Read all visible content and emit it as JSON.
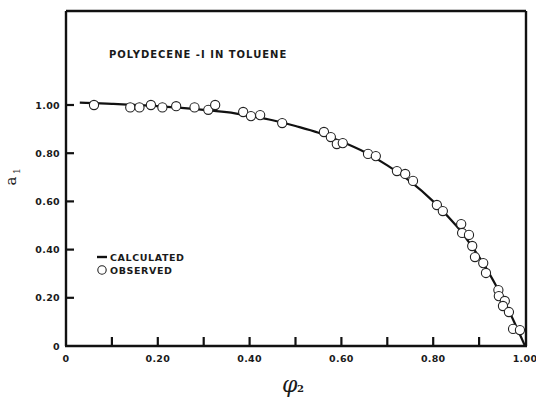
{
  "chart_data": {
    "type": "scatter",
    "title": "POLYDECENE -I IN TOLUENE",
    "xlabel": "φ2",
    "ylabel": "a1",
    "xlim": [
      0,
      1.0
    ],
    "ylim": [
      0,
      1.2
    ],
    "grid": false,
    "legend_position": "inside-left-middle",
    "x_ticks": [
      0,
      0.1,
      0.2,
      0.3,
      0.4,
      0.5,
      0.6,
      0.7,
      0.8,
      0.9,
      1.0
    ],
    "x_tick_labels": [
      {
        "value": 0,
        "label": "0"
      },
      {
        "value": 0.2,
        "label": "0.20"
      },
      {
        "value": 0.4,
        "label": "0.40"
      },
      {
        "value": 0.6,
        "label": "0.60"
      },
      {
        "value": 0.8,
        "label": "0.80"
      },
      {
        "value": 1.0,
        "label": "1.00"
      }
    ],
    "y_tick_labels": [
      {
        "value": 0,
        "label": "0"
      },
      {
        "value": 0.2,
        "label": "0.20"
      },
      {
        "value": 0.4,
        "label": "0.40"
      },
      {
        "value": 0.6,
        "label": "0.60"
      },
      {
        "value": 0.8,
        "label": "0.80"
      },
      {
        "value": 1.0,
        "label": "1.00"
      }
    ],
    "series": [
      {
        "name": "CALCULATED",
        "style": "line",
        "x": [
          0.03,
          0.1,
          0.2,
          0.3,
          0.35,
          0.4,
          0.45,
          0.5,
          0.55,
          0.6,
          0.65,
          0.7,
          0.75,
          0.8,
          0.85,
          0.88,
          0.91,
          0.94,
          0.96,
          0.98,
          1.0
        ],
        "y": [
          1.01,
          1.005,
          0.995,
          0.98,
          0.97,
          0.955,
          0.937,
          0.913,
          0.885,
          0.848,
          0.805,
          0.75,
          0.683,
          0.6,
          0.5,
          0.425,
          0.34,
          0.24,
          0.165,
          0.085,
          0.0
        ]
      },
      {
        "name": "OBSERVED",
        "style": "open-circle",
        "x": [
          0.061,
          0.14,
          0.16,
          0.185,
          0.21,
          0.24,
          0.28,
          0.31,
          0.325,
          0.386,
          0.403,
          0.423,
          0.471,
          0.562,
          0.577,
          0.59,
          0.603,
          0.658,
          0.675,
          0.721,
          0.739,
          0.756,
          0.808,
          0.821,
          0.861,
          0.863,
          0.878,
          0.885,
          0.891,
          0.909,
          0.915,
          0.942,
          0.943,
          0.956,
          0.952,
          0.965,
          0.974,
          0.989
        ],
        "y": [
          1.0,
          0.99,
          0.99,
          1.0,
          0.99,
          0.995,
          0.99,
          0.98,
          1.0,
          0.971,
          0.954,
          0.958,
          0.925,
          0.888,
          0.867,
          0.838,
          0.842,
          0.797,
          0.788,
          0.726,
          0.714,
          0.685,
          0.585,
          0.56,
          0.506,
          0.469,
          0.461,
          0.415,
          0.369,
          0.344,
          0.303,
          0.232,
          0.207,
          0.187,
          0.166,
          0.141,
          0.071,
          0.066
        ]
      }
    ]
  },
  "legend": {
    "calculated_label": "CALCULATED",
    "observed_label": "OBSERVED"
  },
  "axes": {
    "x_title_main": "φ",
    "x_title_sub": "2",
    "y_title_main": "a",
    "y_title_sub": "1"
  },
  "colors": {
    "ink": "#111111",
    "background": "#ffffff"
  }
}
